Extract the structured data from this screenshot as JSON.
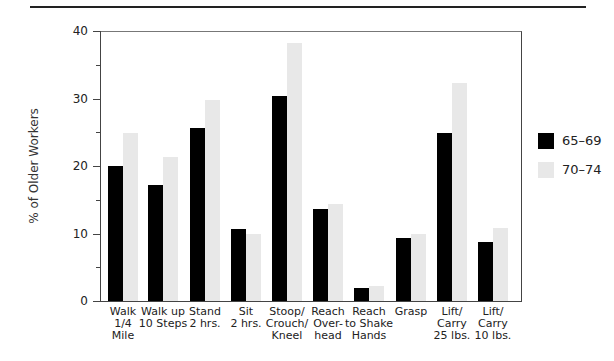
{
  "chart_data": {
    "type": "bar",
    "title": "",
    "xlabel": "",
    "ylabel": "% of Older Workers",
    "ylim": [
      0,
      40
    ],
    "yticks": [
      0,
      10,
      20,
      30,
      40
    ],
    "grid": false,
    "legend_position": "right",
    "categories": [
      "Walk\n1/4\nMile",
      "Walk up\n10 Steps",
      "Stand\n2 hrs.",
      "Sit\n2 hrs.",
      "Stoop/\nCrouch/\nKneel",
      "Reach\nOver-\nhead",
      "Reach\nto Shake\nHands",
      "Grasp",
      "Lift/\nCarry\n25 lbs.",
      "Lift/\nCarry\n10 lbs."
    ],
    "series": [
      {
        "name": "65–69",
        "color": "#000000",
        "values": [
          20.0,
          17.2,
          25.7,
          10.6,
          30.4,
          13.6,
          1.9,
          9.3,
          24.9,
          8.8
        ]
      },
      {
        "name": "70–74",
        "color": "#e8e8e8",
        "values": [
          24.9,
          21.4,
          29.8,
          9.9,
          38.2,
          14.3,
          2.2,
          10.0,
          32.3,
          10.8
        ]
      }
    ]
  },
  "axis": {
    "y_title": "% of Older Workers",
    "y_labels": [
      "40",
      "30",
      "20",
      "10",
      "0"
    ]
  },
  "legend": [
    {
      "label": "65–69",
      "color": "#000000"
    },
    {
      "label": "70–74",
      "color": "#e8e8e8"
    }
  ]
}
